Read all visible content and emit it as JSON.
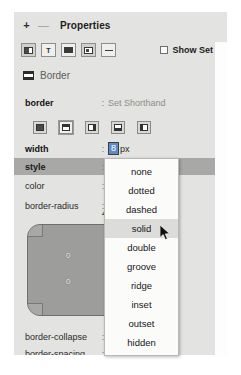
{
  "panel": {
    "header": {
      "add_icon": "+",
      "remove_icon": "—",
      "title": "Properties"
    },
    "toolbar": {
      "buttons": [
        {
          "name": "layout-view",
          "icon": "layout-icon"
        },
        {
          "name": "text-view",
          "icon": "text-icon",
          "glyph": "T"
        },
        {
          "name": "box-view",
          "icon": "box-icon"
        },
        {
          "name": "grid-view",
          "icon": "grid-icon"
        },
        {
          "name": "collapse-view",
          "icon": "collapse-icon"
        }
      ],
      "show_set": {
        "label": "Show Set",
        "checked": false
      }
    },
    "section": {
      "title": "Border",
      "icon": "border-box-icon"
    },
    "rows": [
      {
        "name": "border",
        "separator": ":",
        "value": "Set Shorthand"
      },
      {
        "name": "width",
        "separator": ":",
        "value": "8",
        "unit": "px"
      },
      {
        "name": "style",
        "separator": ":",
        "value": ""
      },
      {
        "name": "color",
        "separator": ":",
        "value": ""
      },
      {
        "name": "border-radius",
        "separator": ":",
        "value": ""
      },
      {
        "name": "border-collapse",
        "separator": ":",
        "value": ""
      },
      {
        "name": "border-spacing",
        "separator": ":",
        "value": ""
      }
    ],
    "side_buttons": [
      {
        "label": "border-all",
        "icon": "border-all-icon"
      },
      {
        "label": "border-top",
        "icon": "border-top-icon"
      },
      {
        "label": "border-right",
        "icon": "border-right-icon"
      },
      {
        "label": "border-bottom",
        "icon": "border-bottom-icon"
      },
      {
        "label": "border-left",
        "icon": "border-left-icon"
      }
    ],
    "box_preview": {
      "radius_value": "4r",
      "value_top": "0",
      "value_bottom": "0"
    },
    "dropdown": {
      "items": [
        "none",
        "dotted",
        "dashed",
        "solid",
        "double",
        "groove",
        "ridge",
        "inset",
        "outset",
        "hidden"
      ],
      "hovered": "solid"
    }
  },
  "colors": {
    "panel_bg": "#e3e3e1",
    "row_selected": "#a8a8a6",
    "field_focus": "#5f8bc8",
    "dropdown_bg": "#fbfbfa",
    "preview_box": "#9d9d9b"
  }
}
